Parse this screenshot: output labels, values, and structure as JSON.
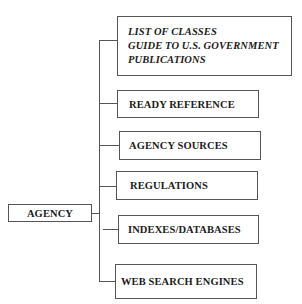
{
  "diagram": {
    "root": {
      "label": "AGENCY"
    },
    "children": [
      {
        "lines": [
          "LIST OF CLASSES",
          "GUIDE TO U.S. GOVERNMENT",
          "PUBLICATIONS"
        ],
        "style": "bold-italic"
      },
      {
        "label": "READY REFERENCE"
      },
      {
        "label": "AGENCY SOURCES"
      },
      {
        "label": "REGULATIONS"
      },
      {
        "label": "INDEXES/DATABASES"
      },
      {
        "label": "WEB SEARCH ENGINES"
      }
    ],
    "colors": {
      "line": "#555555",
      "text": "#1c1c1c",
      "background": "#ffffff"
    }
  }
}
